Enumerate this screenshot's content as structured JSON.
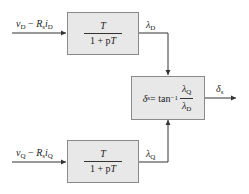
{
  "diagram": {
    "inputs": {
      "top": {
        "var": "v",
        "var_sub": "D",
        "minus": " − ",
        "r": "R",
        "r_sub": "s",
        "i": "i",
        "i_sub": "D"
      },
      "bottom": {
        "var": "v",
        "var_sub": "Q",
        "minus": " − ",
        "r": "R",
        "r_sub": "s",
        "i": "i",
        "i_sub": "Q"
      }
    },
    "blocks": {
      "top": {
        "numerator": "T",
        "denominator_prefix": "1 + p",
        "denominator_var": "T"
      },
      "bottom": {
        "numerator": "T",
        "denominator_prefix": "1 + p",
        "denominator_var": "T"
      },
      "middle": {
        "lhs": "δ",
        "lhs_sub": "s",
        "equals": " = tan",
        "exponent": "−1",
        "frac_num": "λ",
        "frac_num_sub": "Q",
        "frac_den": "λ",
        "frac_den_sub": "D"
      }
    },
    "signals": {
      "lambda_d": {
        "sym": "λ",
        "sub": "D"
      },
      "lambda_q": {
        "sym": "λ",
        "sub": "Q"
      },
      "output": {
        "sym": "δ",
        "sub": "s"
      }
    },
    "colors": {
      "block_fill": "#e8e8e8",
      "block_border": "#8a8a8a",
      "line": "#333333"
    }
  }
}
